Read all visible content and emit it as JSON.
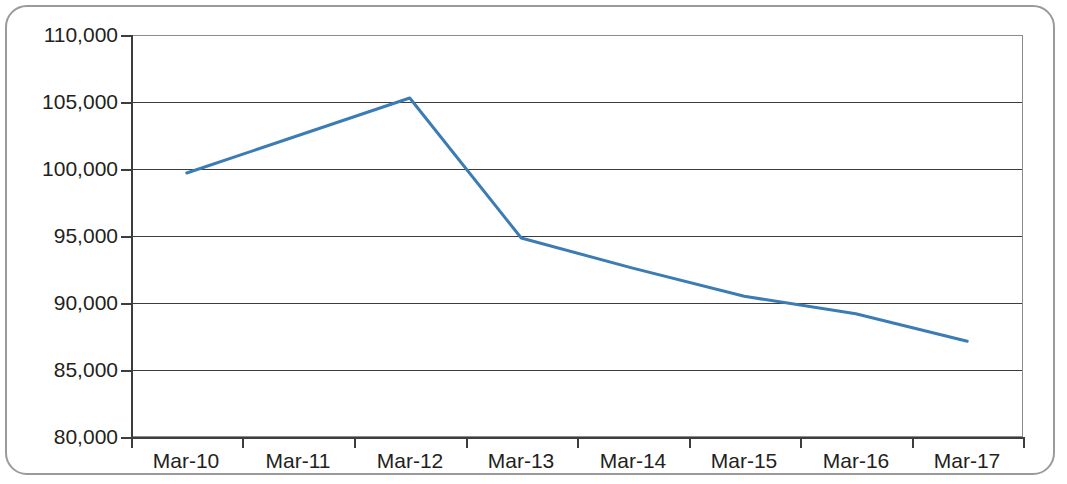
{
  "chart_data": {
    "type": "line",
    "title": "",
    "subtitle": "",
    "xlabel": "",
    "ylabel": "",
    "categories": [
      "Mar-10",
      "Mar-11",
      "Mar-12",
      "Mar-13",
      "Mar-14",
      "Mar-15",
      "Mar-16",
      "Mar-17"
    ],
    "series": [
      {
        "name": "",
        "color": "#3b7cb5",
        "values": [
          99700,
          102500,
          105300,
          94850,
          92600,
          90500,
          89200,
          87150
        ]
      }
    ],
    "ylim": [
      80000,
      110000
    ],
    "y_ticks": [
      80000,
      85000,
      90000,
      95000,
      100000,
      105000,
      110000
    ],
    "y_tick_labels": [
      "80,000",
      "85,000",
      "90,000",
      "95,000",
      "100,000",
      "105,000",
      "110,000"
    ],
    "x_tick_labels": [
      "Mar-10",
      "Mar-11",
      "Mar-12",
      "Mar-13",
      "Mar-14",
      "Mar-15",
      "Mar-16",
      "Mar-17"
    ],
    "grid": true,
    "grid_axis": "y",
    "legend": false,
    "legend_position": "none",
    "markers": false,
    "line_width": 3,
    "frame_color": "#9a9a9a",
    "axis_color": "#3d3d3d",
    "plot_border_color": "#8c8c8c",
    "background_color": "#ffffff"
  },
  "labels": {
    "y": {
      "t0": "80,000",
      "t1": "85,000",
      "t2": "90,000",
      "t3": "95,000",
      "t4": "100,000",
      "t5": "105,000",
      "t6": "110,000"
    },
    "x": {
      "c0": "Mar-10",
      "c1": "Mar-11",
      "c2": "Mar-12",
      "c3": "Mar-13",
      "c4": "Mar-14",
      "c5": "Mar-15",
      "c6": "Mar-16",
      "c7": "Mar-17"
    }
  }
}
